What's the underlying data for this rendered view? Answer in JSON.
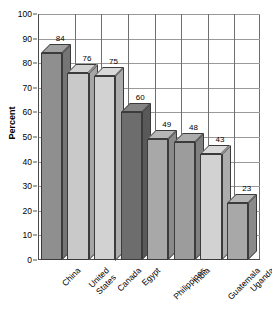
{
  "chart_data": {
    "type": "bar",
    "title": "",
    "subtitle": "",
    "xlabel": "",
    "ylabel": "Percent",
    "ylim": [
      0,
      100
    ],
    "ytick_step": 10,
    "grid": true,
    "legend": "none",
    "style": "3d-bar",
    "categories": [
      "China",
      "United\nStates",
      "Canada",
      "Egypt",
      "Philippines",
      "India",
      "Guatemala",
      "Uganda"
    ],
    "values": [
      84,
      76,
      75,
      60,
      49,
      48,
      43,
      23
    ],
    "value_labels": [
      "84",
      "76",
      "75",
      "60",
      "49",
      "48",
      "43",
      "23"
    ],
    "bar_colors": [
      "#8f8f8f",
      "#c9c9c9",
      "#d2d2d2",
      "#6d6d6d",
      "#a8a8a8",
      "#9c9c9c",
      "#d2d2d2",
      "#a8a8a8"
    ],
    "ytick_labels": [
      "0",
      "10",
      "20",
      "30",
      "40",
      "50",
      "60",
      "70",
      "80",
      "90",
      "100"
    ]
  },
  "axis": {
    "y_title": "Percent"
  },
  "colors": {
    "background": "#ffffff",
    "axis_line": "#4a4a4a",
    "grid_line": "#9a9a9a",
    "bar_outline": "#3b3b3b",
    "text": "#000000"
  }
}
